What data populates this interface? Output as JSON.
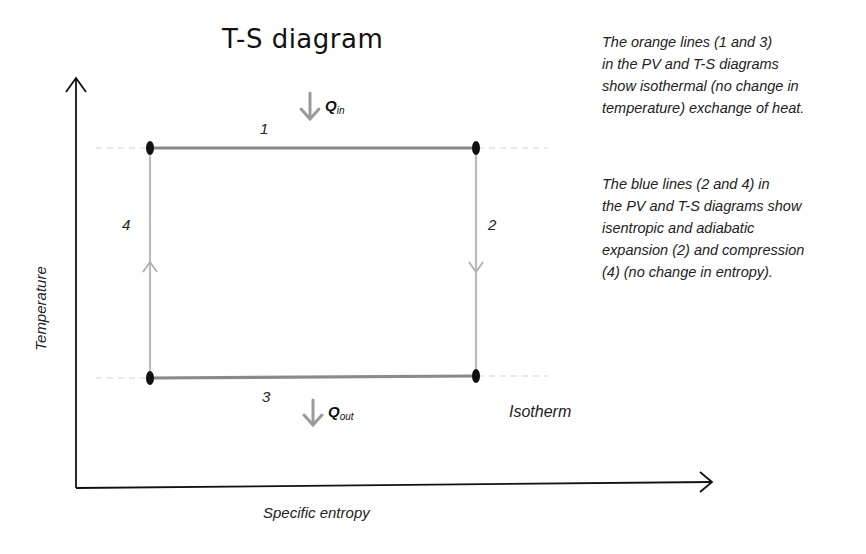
{
  "title": "T-S diagram",
  "axes": {
    "x_label": "Specific entropy",
    "y_label": "Temperature"
  },
  "process_labels": {
    "p1": "1",
    "p2": "2",
    "p3": "3",
    "p4": "4"
  },
  "heat": {
    "q_in_main": "Q",
    "q_in_sub": "in",
    "q_out_main": "Q",
    "q_out_sub": "out"
  },
  "isotherm_label": "Isotherm",
  "notes": {
    "orange": {
      "lines": [
        "The orange lines (1 and 3)",
        "in the PV and T-S diagrams",
        "show isothermal (no change in",
        "temperature) exchange of heat."
      ]
    },
    "blue": {
      "lines": [
        "The blue lines (2 and 4) in",
        "the PV and T-S diagrams show",
        "isentropic and adiabatic",
        "expansion (2) and compression",
        "(4) (no change in entropy)."
      ]
    }
  },
  "colors": {
    "isotherm_line": "#8a8a8a",
    "isentrope_line": "#bdbdbd",
    "axis": "#111111",
    "dashed_guide": "#cfcfcf",
    "node": "#111111",
    "heat_arrow": "#9a9a9a"
  }
}
